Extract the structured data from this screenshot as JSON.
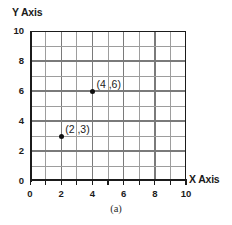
{
  "chart_data": {
    "type": "scatter",
    "title": "",
    "caption": "(a)",
    "xlabel": "X Axis",
    "ylabel": "Y Axis",
    "xlim": [
      0,
      10
    ],
    "ylim": [
      0,
      10
    ],
    "grid": true,
    "grid_step": 1,
    "legend": "none",
    "xticks": [
      0,
      2,
      4,
      6,
      8,
      10
    ],
    "yticks": [
      0,
      2,
      4,
      6,
      8,
      10
    ],
    "xtick_labels": [
      "0",
      "2",
      "4",
      "6",
      "8",
      "10"
    ],
    "ytick_labels": [
      "0",
      "2",
      "4",
      "6",
      "8",
      "10"
    ],
    "points": [
      {
        "x": 4,
        "y": 6,
        "label": "(4 ,6)"
      },
      {
        "x": 2,
        "y": 3,
        "label": "(2 ,3)"
      }
    ],
    "colors": {
      "axis": "#1b1b1b",
      "grid": "#7a7a7a",
      "grid_minor": "#9d9d9d",
      "marker": "#101010",
      "text": "#1b1b1b",
      "background": "#ffffff"
    }
  }
}
